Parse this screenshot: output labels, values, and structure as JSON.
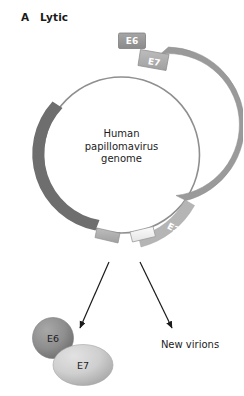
{
  "panel": {
    "letter": "A",
    "title": "Lytic"
  },
  "genome": {
    "line1": "Human",
    "line2": "papillomavirus",
    "line3": "genome"
  },
  "gene_boxes": [
    {
      "id": "e6",
      "label": "E6"
    },
    {
      "id": "e7",
      "label": "E7"
    }
  ],
  "arcs": [
    {
      "id": "e2-arc",
      "label": "E2"
    }
  ],
  "proteins": [
    {
      "id": "e6-protein",
      "label": "E6"
    },
    {
      "id": "e7-protein",
      "label": "E7"
    }
  ],
  "outputs": [
    {
      "id": "new-virions",
      "label": "New virions"
    }
  ],
  "colors": {
    "dark_gray": "#6e6e6e",
    "mid_gray": "#9a9a9a",
    "light_gray": "#b5b5b5",
    "pale_gray": "#d8d8d8",
    "near_white": "#f2f2f2",
    "outline": "#8c8c8c",
    "text": "#1c1c1c",
    "arrow": "#1a1a1a"
  }
}
